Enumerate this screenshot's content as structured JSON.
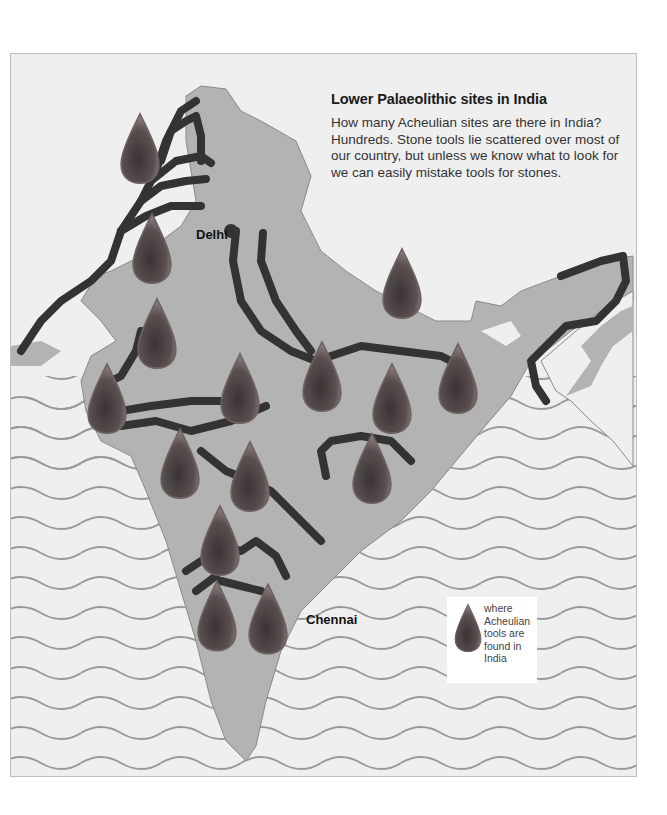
{
  "map": {
    "title": "Lower Palaeolithic sites in India",
    "description": "How many Acheulian sites are there in India? Hundreds. Stone tools lie scattered over most of our country, but unless we know what to look for we can easily mistake tools for stones.",
    "cities": [
      {
        "name": "Delhi"
      },
      {
        "name": "Chennai"
      }
    ],
    "legend": {
      "icon": "acheulian-tool-icon",
      "text": "where Acheulian tools are found in India"
    },
    "marker_count": 17,
    "colors": {
      "background": "#efefef",
      "land": "#b3b3b3",
      "sea": "#ffffff",
      "waves": "#9a9a9a",
      "rivers": "#333333",
      "marker": "#5a5050"
    }
  }
}
